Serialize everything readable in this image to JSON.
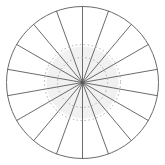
{
  "figure": {
    "title": "Polar grid diagram",
    "description": "Circular polar plot with radial spokes and dotted concentric guide circles",
    "background_color": "#ffffff",
    "frame_color": "#e2e2e2",
    "canvas": {
      "width": 165,
      "height": 165
    }
  },
  "chart_data": {
    "type": "line",
    "title": "",
    "subtitle": "",
    "xlabel": "",
    "ylabel": "",
    "projection": "polar",
    "grid": true,
    "legend_position": "none",
    "center": {
      "x": 82.5,
      "y": 82.5
    },
    "outer_radius": 76,
    "axis_ranges": {
      "theta": [
        0,
        360
      ],
      "r": [
        0,
        76
      ]
    },
    "tick_labels": {
      "theta": [],
      "r": []
    },
    "annotations": [],
    "outer_circle": {
      "name": "outer-boundary",
      "radius": 76,
      "stroke": "#6b6b6b",
      "stroke_width": 1,
      "dashed": false
    },
    "dotted_circles": [
      {
        "name": "inner-guide-ring",
        "radius": 25,
        "stroke": "#b0a8bb",
        "stroke_width": 1,
        "dash": "1.5 2.5"
      },
      {
        "name": "outer-guide-ring",
        "radius": 38,
        "stroke": "#b0a8bb",
        "stroke_width": 1,
        "dash": "1.5 2.5"
      }
    ],
    "spokes": {
      "count": 18,
      "angle_step_degrees": 20,
      "stroke": "#5a5a5a",
      "stroke_width": 0.9,
      "angles_degrees": [
        0,
        20,
        40,
        60,
        80,
        100,
        120,
        140,
        160,
        180,
        200,
        220,
        240,
        260,
        280,
        300,
        320,
        340
      ],
      "radius": 76
    },
    "center_shading": {
      "name": "center-haze",
      "radius": 36,
      "fill": "#d8d8d8",
      "opacity": 0.35
    },
    "series": [
      {
        "name": "radial-spokes",
        "theta": [
          0,
          20,
          40,
          60,
          80,
          100,
          120,
          140,
          160,
          180,
          200,
          220,
          240,
          260,
          280,
          300,
          320,
          340
        ],
        "values": [
          76,
          76,
          76,
          76,
          76,
          76,
          76,
          76,
          76,
          76,
          76,
          76,
          76,
          76,
          76,
          76,
          76,
          76
        ]
      }
    ]
  }
}
